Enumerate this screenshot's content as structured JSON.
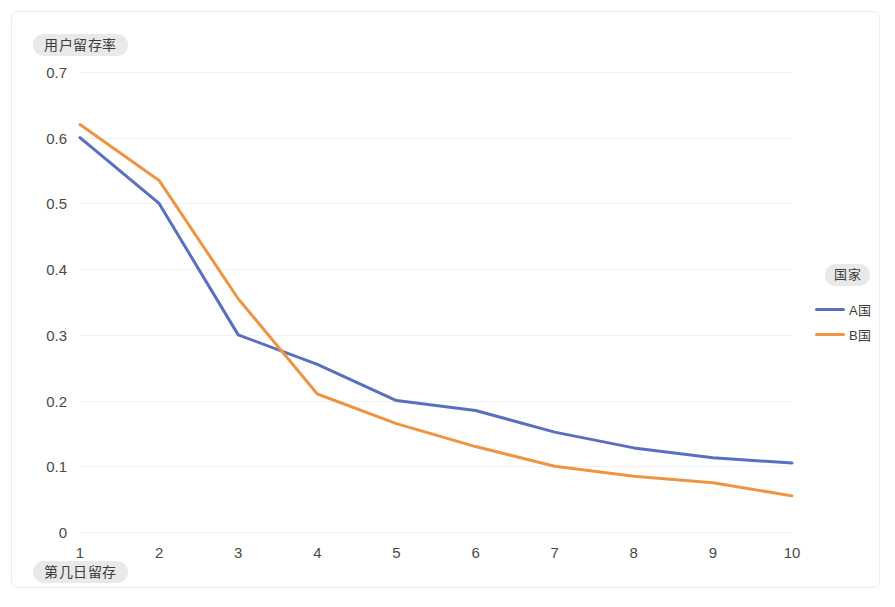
{
  "card": {
    "background": "#ffffff",
    "border_color": "#ececec"
  },
  "y_axis_title": "用户留存率",
  "x_axis_title": "第几日留存",
  "legend": {
    "title": "国家",
    "position": "right",
    "entries": [
      {
        "label": "A国",
        "color": "#5a6fc0"
      },
      {
        "label": "B国",
        "color": "#ef9442"
      }
    ]
  },
  "chart_data": {
    "type": "line",
    "title": "",
    "xlabel": "第几日留存",
    "ylabel": "用户留存率",
    "x": [
      1,
      2,
      3,
      4,
      5,
      6,
      7,
      8,
      9,
      10
    ],
    "categories": [
      "1",
      "2",
      "3",
      "4",
      "5",
      "6",
      "7",
      "8",
      "9",
      "10"
    ],
    "xlim": [
      1,
      10
    ],
    "ylim": [
      0,
      0.7
    ],
    "ytick_labels": [
      "0.7",
      "0.6",
      "0.5",
      "0.4",
      "0.3",
      "0.2",
      "0.1",
      "0"
    ],
    "ytick_values": [
      0.7,
      0.6,
      0.5,
      0.4,
      0.3,
      0.2,
      0.1,
      0
    ],
    "grid": true,
    "grid_color": "#f2f2f2",
    "series": [
      {
        "name": "A国",
        "color": "#5a6fc0",
        "values": [
          0.6,
          0.5,
          0.3,
          0.255,
          0.2,
          0.185,
          0.152,
          0.128,
          0.113,
          0.105
        ]
      },
      {
        "name": "B国",
        "color": "#ef9442",
        "values": [
          0.62,
          0.535,
          0.355,
          0.21,
          0.165,
          0.13,
          0.1,
          0.085,
          0.075,
          0.055
        ]
      }
    ]
  }
}
